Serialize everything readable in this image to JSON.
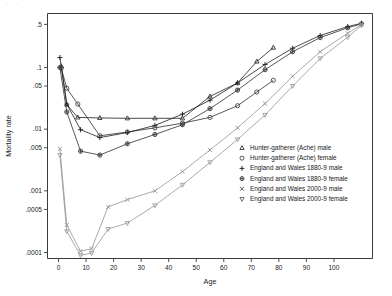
{
  "figure": {
    "top_fragment": "· ·",
    "background": "#ffffff",
    "frame_color": "#3a3a3a"
  },
  "chart_data": {
    "type": "line",
    "title": "",
    "xlabel": "Age",
    "ylabel": "Mortality rate",
    "xlim": [
      -4,
      114
    ],
    "ylim": [
      8e-05,
      0.75
    ],
    "yscale": "log",
    "grid": false,
    "legend_position": "right-middle",
    "xticks": [
      0,
      10,
      20,
      30,
      40,
      50,
      60,
      70,
      80,
      90,
      100
    ],
    "xtick_labels": [
      "0",
      "10",
      "20",
      "30",
      "40",
      "50",
      "60",
      "70",
      "80",
      "90",
      "100"
    ],
    "yticks": [
      0.5,
      0.1,
      0.05,
      0.01,
      0.005,
      0.001,
      0.0005,
      0.0001
    ],
    "ytick_labels": [
      ".5",
      ".1",
      ".05",
      ".01",
      ".005",
      ".001",
      ".0005",
      ".0001"
    ],
    "series": [
      {
        "name": "Hunter-gatherer (Ache) male",
        "marker": "triangle-up",
        "color": "#2b2b2b",
        "x": [
          1,
          3,
          7,
          15,
          25,
          35,
          45,
          55,
          65,
          72,
          78
        ],
        "y": [
          0.105,
          0.025,
          0.0155,
          0.0152,
          0.015,
          0.015,
          0.015,
          0.034,
          0.056,
          0.125,
          0.21
        ]
      },
      {
        "name": "Hunter-gatherer (Ache) female",
        "marker": "circle",
        "color": "#3a3a3a",
        "x": [
          1,
          3,
          7,
          15,
          25,
          35,
          45,
          55,
          65,
          72,
          78
        ],
        "y": [
          0.098,
          0.046,
          0.0255,
          0.0078,
          0.009,
          0.0105,
          0.0125,
          0.0155,
          0.024,
          0.04,
          0.062
        ]
      },
      {
        "name": "England and Wales 1880-9 male",
        "marker": "plus",
        "color": "#2b2b2b",
        "x": [
          0.5,
          3,
          8,
          15,
          25,
          35,
          45,
          55,
          65,
          75,
          85,
          95,
          105,
          110
        ],
        "y": [
          0.145,
          0.0255,
          0.0098,
          0.0073,
          0.0088,
          0.0115,
          0.0175,
          0.0295,
          0.056,
          0.112,
          0.205,
          0.33,
          0.46,
          0.52
        ]
      },
      {
        "name": "England and Wales 1880-9 female",
        "marker": "diamond",
        "color": "#3a3a3a",
        "x": [
          0.5,
          3,
          8,
          15,
          25,
          35,
          45,
          55,
          65,
          75,
          85,
          95,
          105,
          110
        ],
        "y": [
          0.1,
          0.019,
          0.0044,
          0.0038,
          0.0058,
          0.0082,
          0.0118,
          0.0215,
          0.043,
          0.092,
          0.18,
          0.305,
          0.44,
          0.51
        ]
      },
      {
        "name": "England and Wales 2000-9 male",
        "marker": "cross",
        "color": "#999999",
        "x": [
          0.5,
          3,
          8,
          12,
          18,
          25,
          35,
          45,
          55,
          65,
          75,
          85,
          95,
          105,
          110
        ],
        "y": [
          0.0048,
          0.00028,
          0.000105,
          0.000115,
          0.00055,
          0.00072,
          0.001,
          0.00205,
          0.0046,
          0.0105,
          0.026,
          0.072,
          0.18,
          0.36,
          0.5
        ]
      },
      {
        "name": "England and Wales 2000-9 female",
        "marker": "triangle-down",
        "color": "#999999",
        "x": [
          0.5,
          3,
          8,
          12,
          18,
          25,
          35,
          45,
          55,
          65,
          75,
          85,
          95,
          105,
          110
        ],
        "y": [
          0.0038,
          0.00022,
          9e-05,
          9.8e-05,
          0.00024,
          0.0003,
          0.00058,
          0.00125,
          0.0029,
          0.0068,
          0.017,
          0.05,
          0.14,
          0.31,
          0.48
        ]
      }
    ]
  },
  "legend": {
    "items": [
      {
        "label": "Hunter-gatherer (Ache) male",
        "marker": "triangle-up",
        "color": "#2b2b2b"
      },
      {
        "label": "Hunter-gatherer (Ache) female",
        "marker": "circle",
        "color": "#3a3a3a"
      },
      {
        "label": "England and Wales 1880-9 male",
        "marker": "plus",
        "color": "#2b2b2b"
      },
      {
        "label": "England and Wales 1880-9 female",
        "marker": "diamond",
        "color": "#3a3a3a"
      },
      {
        "label": "England and Wales 2000-9 male",
        "marker": "cross",
        "color": "#555555"
      },
      {
        "label": "England and Wales 2000-9 female",
        "marker": "triangle-down",
        "color": "#555555"
      }
    ]
  }
}
